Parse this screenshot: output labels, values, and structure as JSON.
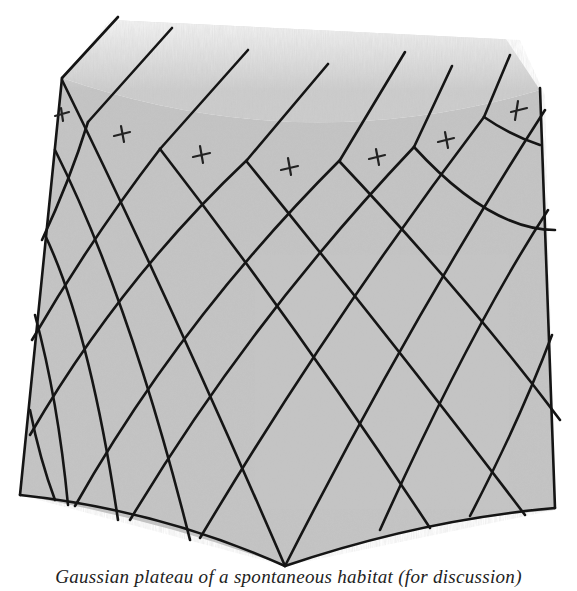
{
  "figure": {
    "shading_color": "#b8b8b8",
    "line_color": "#151515",
    "markers": [
      {
        "symbol": "+",
        "x": 62,
        "y": 115
      },
      {
        "symbol": "+",
        "x": 122,
        "y": 134
      },
      {
        "symbol": "+",
        "x": 202,
        "y": 155
      },
      {
        "symbol": "+",
        "x": 290,
        "y": 168
      },
      {
        "symbol": "+",
        "x": 377,
        "y": 157
      },
      {
        "symbol": "+",
        "x": 446,
        "y": 140
      },
      {
        "symbol": "+",
        "x": 519,
        "y": 110
      }
    ]
  },
  "caption": {
    "text": "Gaussian plateau of a spontaneous habitat (for discussion)"
  }
}
